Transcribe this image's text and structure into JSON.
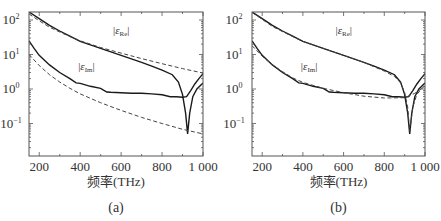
{
  "chart_data": [
    {
      "panel": "a",
      "caption": "(a)",
      "type": "line",
      "title": "",
      "xlabel": "频率(THz)",
      "ylabel": "",
      "xscale": "linear",
      "yscale": "log",
      "xlim": [
        150,
        1000
      ],
      "ylim": [
        0.04,
        180
      ],
      "xticks": [
        200,
        400,
        600,
        800,
        1000
      ],
      "xtick_labels": [
        "200",
        "400",
        "600",
        "800",
        "1 000"
      ],
      "yticks": [
        100,
        10,
        1,
        0.1
      ],
      "ytick_labels": [
        "10^2",
        "10^1",
        "10^0",
        "10^-1"
      ],
      "grid": false,
      "annotations": [
        {
          "text": "|ε_Re|",
          "x": 560,
          "y": 40
        },
        {
          "text": "|ε_Im|",
          "x": 390,
          "y": 3.5
        }
      ],
      "series": [
        {
          "name": "|ε_Re| measured",
          "style": "solid",
          "x": [
            150,
            200,
            250,
            300,
            350,
            400,
            450,
            500,
            550,
            600,
            650,
            700,
            750,
            800,
            850,
            880,
            900,
            915,
            925,
            935,
            950,
            970,
            1000
          ],
          "y": [
            170,
            110,
            70,
            48,
            34,
            24,
            19,
            15,
            12,
            9.5,
            7.5,
            5.9,
            4.6,
            3.5,
            2.6,
            1.6,
            0.7,
            0.2,
            0.05,
            0.2,
            0.6,
            1.0,
            1.5
          ]
        },
        {
          "name": "|ε_Re| model",
          "style": "dashed",
          "x": [
            150,
            200,
            250,
            300,
            350,
            400,
            500,
            600,
            700,
            800,
            900,
            1000
          ],
          "y": [
            150,
            95,
            62,
            45,
            33,
            25,
            16,
            11,
            7.6,
            5.4,
            3.9,
            2.9
          ]
        },
        {
          "name": "|ε_Im| measured",
          "style": "solid",
          "x": [
            150,
            175,
            200,
            250,
            300,
            350,
            380,
            400,
            450,
            500,
            530,
            550,
            600,
            650,
            700,
            750,
            800,
            840,
            870,
            900,
            920,
            940,
            960,
            980,
            1000
          ],
          "y": [
            25,
            15,
            9.5,
            5,
            3,
            2,
            1.5,
            1.45,
            1.2,
            1.05,
            0.82,
            0.8,
            0.78,
            0.75,
            0.75,
            0.72,
            0.68,
            0.6,
            0.6,
            0.58,
            0.6,
            0.9,
            1.4,
            2.0,
            2.8
          ]
        },
        {
          "name": "|ε_Im| model",
          "style": "dashed",
          "x": [
            150,
            200,
            250,
            300,
            350,
            400,
            500,
            600,
            700,
            800,
            900,
            1000
          ],
          "y": [
            10,
            4.8,
            2.6,
            1.6,
            1.05,
            0.72,
            0.4,
            0.24,
            0.15,
            0.1,
            0.068,
            0.05
          ]
        }
      ]
    },
    {
      "panel": "b",
      "caption": "(b)",
      "type": "line",
      "title": "",
      "xlabel": "频率(THz)",
      "ylabel": "",
      "xscale": "linear",
      "yscale": "log",
      "xlim": [
        150,
        1000
      ],
      "ylim": [
        0.04,
        180
      ],
      "xticks": [
        200,
        400,
        600,
        800,
        1000
      ],
      "xtick_labels": [
        "200",
        "400",
        "600",
        "800",
        "1 000"
      ],
      "yticks": [
        100,
        10,
        1,
        0.1
      ],
      "ytick_labels": [
        "10^2",
        "10^1",
        "10^0",
        "10^-1"
      ],
      "grid": false,
      "annotations": [
        {
          "text": "|ε_Re|",
          "x": 560,
          "y": 40
        },
        {
          "text": "|ε_Im|",
          "x": 390,
          "y": 3.5
        }
      ],
      "series": [
        {
          "name": "|ε_Re| measured",
          "style": "solid",
          "x": [
            150,
            200,
            250,
            300,
            350,
            400,
            450,
            500,
            550,
            600,
            650,
            700,
            750,
            800,
            850,
            880,
            900,
            915,
            925,
            935,
            950,
            970,
            1000
          ],
          "y": [
            170,
            110,
            70,
            48,
            34,
            24,
            19,
            15,
            12,
            9.5,
            7.5,
            5.9,
            4.6,
            3.5,
            2.6,
            1.6,
            0.7,
            0.2,
            0.05,
            0.2,
            0.6,
            1.0,
            1.5
          ]
        },
        {
          "name": "|ε_Re| model",
          "style": "dashed",
          "x": [
            150,
            200,
            250,
            300,
            350,
            400,
            500,
            600,
            700,
            800,
            850,
            880,
            900,
            915,
            925,
            940,
            960,
            1000
          ],
          "y": [
            165,
            105,
            65,
            46,
            33,
            24,
            15,
            9.5,
            5.9,
            3.3,
            2.3,
            1.5,
            0.8,
            0.3,
            0.06,
            0.3,
            0.7,
            1.3
          ]
        },
        {
          "name": "|ε_Im| measured",
          "style": "solid",
          "x": [
            150,
            175,
            200,
            250,
            300,
            350,
            380,
            400,
            450,
            500,
            530,
            550,
            600,
            650,
            700,
            750,
            800,
            840,
            870,
            900,
            920,
            940,
            960,
            980,
            1000
          ],
          "y": [
            25,
            15,
            9.5,
            5,
            3,
            2,
            1.5,
            1.45,
            1.2,
            1.05,
            0.82,
            0.8,
            0.78,
            0.75,
            0.75,
            0.72,
            0.68,
            0.6,
            0.6,
            0.58,
            0.6,
            0.9,
            1.4,
            2.0,
            2.8
          ]
        },
        {
          "name": "|ε_Im| model",
          "style": "dashed",
          "x": [
            150,
            200,
            250,
            300,
            350,
            400,
            500,
            600,
            700,
            800,
            900,
            950,
            1000
          ],
          "y": [
            18,
            9,
            5,
            3.2,
            2.1,
            1.55,
            1.05,
            0.78,
            0.62,
            0.55,
            0.56,
            0.75,
            1.2
          ]
        }
      ]
    }
  ]
}
